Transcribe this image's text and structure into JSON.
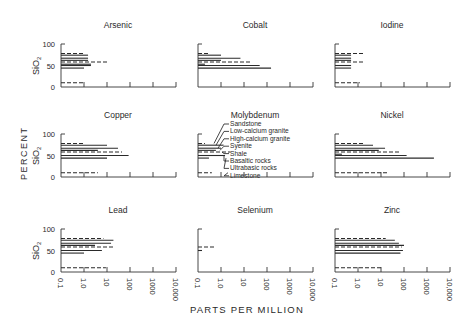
{
  "figure": {
    "ylabel_outer": "PERCENT",
    "ylabel_inner": "SiO2",
    "xlabel": "PARTS PER MILLION",
    "xtick_labels": [
      "0.1",
      "1.0",
      "10",
      "100",
      "1000",
      "10,000"
    ],
    "ytick_labels": [
      "0",
      "50",
      "100"
    ]
  },
  "chart_data": {
    "type": "bar",
    "orientation": "horizontal",
    "title": "",
    "xlabel": "PARTS PER MILLION",
    "ylabel": "PERCENT SiO2",
    "xscale": "log",
    "xlim": [
      0.1,
      10000
    ],
    "ylim": [
      0,
      100
    ],
    "grid": false,
    "legend": {
      "location": "Molybdenum panel",
      "entries": [
        {
          "rock": "Sandstone",
          "sio2": 78,
          "style": "dashed"
        },
        {
          "rock": "Low-calcium granite",
          "sio2": 74,
          "style": "solid"
        },
        {
          "rock": "High-calcium granite",
          "sio2": 67,
          "style": "solid"
        },
        {
          "rock": "Syenite",
          "sio2": 62,
          "style": "solid"
        },
        {
          "rock": "Shale",
          "sio2": 58,
          "style": "dashed"
        },
        {
          "rock": "Basaltic rocks",
          "sio2": 50,
          "style": "solid"
        },
        {
          "rock": "Ultrabasic rocks",
          "sio2": 44,
          "style": "solid"
        },
        {
          "rock": "Limestone",
          "sio2": 10,
          "style": "dashed"
        }
      ]
    },
    "panels": [
      {
        "element": "Arsenic",
        "bars": [
          {
            "sio2": 78,
            "ppm": 1,
            "style": "dashed"
          },
          {
            "sio2": 74,
            "ppm": 1.5,
            "style": "solid"
          },
          {
            "sio2": 67,
            "ppm": 1.5,
            "style": "solid"
          },
          {
            "sio2": 62,
            "ppm": 1.5,
            "style": "solid"
          },
          {
            "sio2": 58,
            "ppm": 10,
            "style": "dashed"
          },
          {
            "sio2": 53,
            "ppm": 2,
            "style": "solid"
          },
          {
            "sio2": 50,
            "ppm": 2,
            "style": "solid"
          },
          {
            "sio2": 44,
            "ppm": 1,
            "style": "solid"
          },
          {
            "sio2": 10,
            "ppm": 1,
            "style": "dashed"
          }
        ]
      },
      {
        "element": "Cobalt",
        "bars": [
          {
            "sio2": 78,
            "ppm": 0.3,
            "style": "dashed"
          },
          {
            "sio2": 74,
            "ppm": 1,
            "style": "solid"
          },
          {
            "sio2": 67,
            "ppm": 7,
            "style": "solid"
          },
          {
            "sio2": 62,
            "ppm": 1,
            "style": "solid"
          },
          {
            "sio2": 58,
            "ppm": 20,
            "style": "dashed"
          },
          {
            "sio2": 53,
            "ppm": 0.2,
            "style": "solid"
          },
          {
            "sio2": 50,
            "ppm": 48,
            "style": "solid"
          },
          {
            "sio2": 44,
            "ppm": 150,
            "style": "solid"
          }
        ]
      },
      {
        "element": "Iodine",
        "bars": [
          {
            "sio2": 78,
            "ppm": 2,
            "style": "dashed"
          },
          {
            "sio2": 74,
            "ppm": 0.5,
            "style": "solid"
          },
          {
            "sio2": 67,
            "ppm": 0.5,
            "style": "solid"
          },
          {
            "sio2": 62,
            "ppm": 0.5,
            "style": "solid"
          },
          {
            "sio2": 58,
            "ppm": 2,
            "style": "dashed"
          },
          {
            "sio2": 50,
            "ppm": 0.5,
            "style": "solid"
          },
          {
            "sio2": 44,
            "ppm": 0.5,
            "style": "solid"
          },
          {
            "sio2": 10,
            "ppm": 1.2,
            "style": "dashed"
          }
        ]
      },
      {
        "element": "Copper",
        "bars": [
          {
            "sio2": 78,
            "ppm": 1,
            "style": "dashed"
          },
          {
            "sio2": 74,
            "ppm": 10,
            "style": "solid"
          },
          {
            "sio2": 67,
            "ppm": 30,
            "style": "solid"
          },
          {
            "sio2": 62,
            "ppm": 4,
            "style": "solid"
          },
          {
            "sio2": 58,
            "ppm": 45,
            "style": "dashed"
          },
          {
            "sio2": 50,
            "ppm": 87,
            "style": "solid"
          },
          {
            "sio2": 44,
            "ppm": 10,
            "style": "solid"
          },
          {
            "sio2": 10,
            "ppm": 4,
            "style": "dashed"
          }
        ]
      },
      {
        "element": "Molybdenum",
        "bars": [
          {
            "sio2": 78,
            "ppm": 0.2,
            "style": "dashed"
          },
          {
            "sio2": 74,
            "ppm": 1.3,
            "style": "solid"
          },
          {
            "sio2": 67,
            "ppm": 1,
            "style": "solid"
          },
          {
            "sio2": 62,
            "ppm": 0.6,
            "style": "solid"
          },
          {
            "sio2": 58,
            "ppm": 2.6,
            "style": "dashed"
          },
          {
            "sio2": 50,
            "ppm": 1.5,
            "style": "solid"
          },
          {
            "sio2": 44,
            "ppm": 0.3,
            "style": "solid"
          },
          {
            "sio2": 10,
            "ppm": 0.4,
            "style": "dashed"
          }
        ]
      },
      {
        "element": "Nickel",
        "bars": [
          {
            "sio2": 78,
            "ppm": 2,
            "style": "dashed"
          },
          {
            "sio2": 74,
            "ppm": 4.5,
            "style": "solid"
          },
          {
            "sio2": 67,
            "ppm": 15,
            "style": "solid"
          },
          {
            "sio2": 62,
            "ppm": 8,
            "style": "solid"
          },
          {
            "sio2": 58,
            "ppm": 68,
            "style": "dashed"
          },
          {
            "sio2": 53,
            "ppm": 0.2,
            "style": "solid"
          },
          {
            "sio2": 50,
            "ppm": 130,
            "style": "solid"
          },
          {
            "sio2": 44,
            "ppm": 2000,
            "style": "solid"
          },
          {
            "sio2": 10,
            "ppm": 20,
            "style": "dashed"
          }
        ]
      },
      {
        "element": "Lead",
        "bars": [
          {
            "sio2": 78,
            "ppm": 7,
            "style": "dashed"
          },
          {
            "sio2": 74,
            "ppm": 19,
            "style": "solid"
          },
          {
            "sio2": 67,
            "ppm": 15,
            "style": "solid"
          },
          {
            "sio2": 62,
            "ppm": 3,
            "style": "solid"
          },
          {
            "sio2": 58,
            "ppm": 20,
            "style": "dashed"
          },
          {
            "sio2": 50,
            "ppm": 6,
            "style": "solid"
          },
          {
            "sio2": 44,
            "ppm": 1,
            "style": "solid"
          },
          {
            "sio2": 10,
            "ppm": 9,
            "style": "dashed"
          }
        ]
      },
      {
        "element": "Selenium",
        "bars": [
          {
            "sio2": 58,
            "ppm": 0.6,
            "style": "dashed"
          },
          {
            "sio2": 50,
            "ppm": 0.05,
            "style": "solid"
          }
        ]
      },
      {
        "element": "Zinc",
        "bars": [
          {
            "sio2": 78,
            "ppm": 16,
            "style": "dashed"
          },
          {
            "sio2": 74,
            "ppm": 40,
            "style": "solid"
          },
          {
            "sio2": 67,
            "ppm": 60,
            "style": "solid"
          },
          {
            "sio2": 62,
            "ppm": 100,
            "style": "solid"
          },
          {
            "sio2": 58,
            "ppm": 80,
            "style": "dashed"
          },
          {
            "sio2": 50,
            "ppm": 90,
            "style": "solid"
          },
          {
            "sio2": 44,
            "ppm": 70,
            "style": "solid"
          },
          {
            "sio2": 10,
            "ppm": 10,
            "style": "dashed"
          }
        ]
      }
    ]
  }
}
